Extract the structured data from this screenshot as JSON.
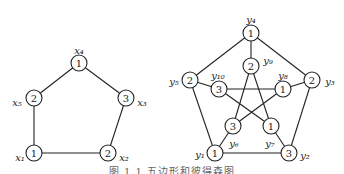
{
  "figure": {
    "caption": "图 1.1 五边形和彼得森图",
    "left_graph": {
      "name": "5-cycle",
      "nodes": [
        {
          "id": "x1",
          "label": "x₁",
          "color": "1",
          "x": 34,
          "y": 153,
          "lx": 20,
          "ly": 157
        },
        {
          "id": "x2",
          "label": "x₂",
          "color": "2",
          "x": 108,
          "y": 153,
          "lx": 124,
          "ly": 157
        },
        {
          "id": "x3",
          "label": "x₃",
          "color": "3",
          "x": 126,
          "y": 98,
          "lx": 142,
          "ly": 102
        },
        {
          "id": "x4",
          "label": "x₄",
          "color": "1",
          "x": 79,
          "y": 63,
          "lx": 79,
          "ly": 50
        },
        {
          "id": "x5",
          "label": "x₅",
          "color": "2",
          "x": 34,
          "y": 98,
          "lx": 17,
          "ly": 102
        }
      ],
      "edges": [
        [
          "x1",
          "x2"
        ],
        [
          "x2",
          "x3"
        ],
        [
          "x3",
          "x4"
        ],
        [
          "x4",
          "x5"
        ],
        [
          "x5",
          "x1"
        ]
      ]
    },
    "right_graph": {
      "name": "Petersen graph",
      "nodes": [
        {
          "id": "y1",
          "label": "y₁",
          "color": "1",
          "x": 215,
          "y": 153,
          "lx": 200,
          "ly": 154
        },
        {
          "id": "y2",
          "label": "y₂",
          "color": "3",
          "x": 289,
          "y": 153,
          "lx": 305,
          "ly": 155
        },
        {
          "id": "y3",
          "label": "y₃",
          "color": "2",
          "x": 312,
          "y": 80,
          "lx": 330,
          "ly": 81
        },
        {
          "id": "y4",
          "label": "y₄",
          "color": "1",
          "x": 251,
          "y": 33,
          "lx": 251,
          "ly": 19
        },
        {
          "id": "y5",
          "label": "y₅",
          "color": "2",
          "x": 190,
          "y": 80,
          "lx": 174,
          "ly": 81
        },
        {
          "id": "y6",
          "label": "y₆",
          "color": "3",
          "x": 233,
          "y": 126,
          "lx": 234,
          "ly": 143
        },
        {
          "id": "y7",
          "label": "y₇",
          "color": "1",
          "x": 271,
          "y": 126,
          "lx": 270,
          "ly": 143
        },
        {
          "id": "y8",
          "label": "y₈",
          "color": "1",
          "x": 283,
          "y": 89,
          "lx": 283,
          "ly": 75
        },
        {
          "id": "y9",
          "label": "y₉",
          "color": "2",
          "x": 251,
          "y": 66,
          "lx": 268,
          "ly": 60
        },
        {
          "id": "y10",
          "label": "y₁₀",
          "color": "3",
          "x": 219,
          "y": 89,
          "lx": 218,
          "ly": 75
        }
      ],
      "edges": [
        [
          "y1",
          "y2"
        ],
        [
          "y2",
          "y3"
        ],
        [
          "y3",
          "y4"
        ],
        [
          "y4",
          "y5"
        ],
        [
          "y5",
          "y1"
        ],
        [
          "y4",
          "y9"
        ],
        [
          "y5",
          "y10"
        ],
        [
          "y3",
          "y8"
        ],
        [
          "y1",
          "y6"
        ],
        [
          "y2",
          "y7"
        ],
        [
          "y10",
          "y8"
        ],
        [
          "y10",
          "y7"
        ],
        [
          "y9",
          "y6"
        ],
        [
          "y9",
          "y7"
        ],
        [
          "y8",
          "y6"
        ]
      ]
    }
  }
}
